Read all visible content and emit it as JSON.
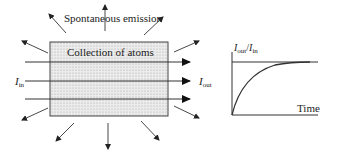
{
  "diagram": {
    "emission_label": "Spontaneous emission",
    "box_label": "Collection of atoms",
    "input_label": {
      "main": "I",
      "sub": "in"
    },
    "output_label": {
      "main": "I",
      "sub": "out"
    },
    "colors": {
      "stroke": "#333333",
      "fill": "#e6e6e6",
      "dot": "#9a9a9a"
    }
  },
  "graph": {
    "ylabel": {
      "num_main": "I",
      "num_sub": "out",
      "sep": "/",
      "den_main": "I",
      "den_sub": "in"
    },
    "xlabel": "Time",
    "curve": "saturating exponential rising from 0 to plateau"
  }
}
